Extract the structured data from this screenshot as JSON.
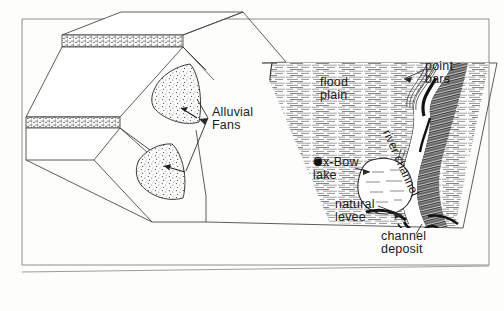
{
  "figure": {
    "type": "geologic-block-diagram",
    "border_color": "#7a7a78",
    "ink_color": "#1a1a1a",
    "paper_color": "#fdfdfc"
  },
  "labels": {
    "alluvial_fans": "Alluvial\nFans",
    "flood_plain": "flood\nplain",
    "point_bars": "point\nbars",
    "ox_bow_lake": "Ox-Bow\nlake",
    "natural_levee": "natural\nlevee",
    "channel_deposit": "channel\ndeposit",
    "river_channel": "river channel"
  },
  "features": [
    {
      "name": "mountain-block-upper",
      "kind": "faulted bedrock block"
    },
    {
      "name": "mountain-block-lower",
      "kind": "faulted bedrock block"
    },
    {
      "name": "fault-trace-upper",
      "kind": "fault scarp"
    },
    {
      "name": "fault-trace-lower",
      "kind": "fault scarp"
    },
    {
      "name": "alluvial-fan-upper",
      "kind": "stippled alluvial fan"
    },
    {
      "name": "alluvial-fan-lower",
      "kind": "stippled alluvial fan"
    },
    {
      "name": "flood-plain-surface",
      "kind": "hachured flood plain"
    },
    {
      "name": "river-channel",
      "kind": "meandering channel"
    },
    {
      "name": "point-bar-deposits",
      "kind": "point bars"
    },
    {
      "name": "ox-bow-lake",
      "kind": "abandoned meander"
    },
    {
      "name": "natural-levee",
      "kind": "levee ridge"
    },
    {
      "name": "channel-deposit",
      "kind": "channel fill in cross-section"
    }
  ]
}
